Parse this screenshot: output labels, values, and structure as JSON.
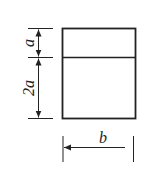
{
  "diagram": {
    "labels": {
      "top_height": "a",
      "bottom_height": "2a",
      "width": "b"
    },
    "colors": {
      "line": "#222222",
      "background": "#ffffff"
    }
  }
}
